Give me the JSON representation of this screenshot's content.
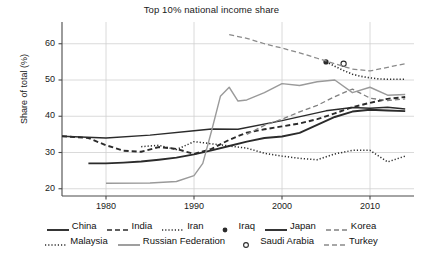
{
  "chart_data": {
    "type": "line",
    "title": "Top 10% national income share",
    "xlabel": "",
    "ylabel": "Share of total (%)",
    "xlim": [
      1975,
      2015
    ],
    "ylim": [
      18,
      66
    ],
    "xticks": [
      1980,
      1990,
      2000,
      2010
    ],
    "yticks": [
      20,
      30,
      40,
      50,
      60
    ],
    "grid": true,
    "legend_position": "bottom",
    "series": [
      {
        "name": "China",
        "style": "solid",
        "color": "#2b2b2b",
        "width": 1.9,
        "x": [
          1978,
          1980,
          1982,
          1984,
          1986,
          1988,
          1990,
          1992,
          1994,
          1996,
          1998,
          2000,
          2002,
          2004,
          2006,
          2008,
          2010,
          2012,
          2014
        ],
        "values": [
          27.0,
          27.0,
          27.2,
          27.5,
          28.0,
          28.6,
          29.5,
          30.6,
          31.8,
          33.0,
          34.0,
          34.4,
          35.4,
          37.6,
          39.8,
          41.3,
          41.8,
          41.6,
          41.4
        ]
      },
      {
        "name": "India",
        "style": "dashed",
        "color": "#2b2b2b",
        "width": 1.9,
        "x": [
          1975,
          1978,
          1980,
          1982,
          1984,
          1986,
          1988,
          1990,
          1992,
          1994,
          1996,
          1998,
          2000,
          2002,
          2004,
          2006,
          2008,
          2010,
          2012,
          2014
        ],
        "values": [
          34.5,
          34.0,
          32.0,
          30.5,
          30.2,
          31.5,
          31.0,
          29.6,
          31.0,
          33.5,
          35.5,
          36.4,
          37.2,
          38.0,
          39.2,
          40.8,
          42.5,
          43.7,
          44.8,
          45.3
        ]
      },
      {
        "name": "Iran",
        "style": "dotted",
        "color": "#2b2b2b",
        "width": 1.6,
        "x": [
          2005,
          2006,
          2007,
          2008,
          2009,
          2010,
          2011,
          2012,
          2013,
          2014
        ],
        "values": [
          55.0,
          53.8,
          52.6,
          51.6,
          51.0,
          50.6,
          50.3,
          50.2,
          50.2,
          50.2
        ]
      },
      {
        "name": "Iraq",
        "style": "marker-filled",
        "color": "#2b2b2b",
        "width": 0,
        "x": [
          2005
        ],
        "values": [
          55.0
        ]
      },
      {
        "name": "Japan",
        "style": "solid",
        "color": "#2b2b2b",
        "width": 1.4,
        "x": [
          1975,
          1980,
          1985,
          1990,
          1992,
          1995,
          2000,
          2005,
          2008,
          2010,
          2012,
          2014
        ],
        "values": [
          34.5,
          34.0,
          34.8,
          36.0,
          36.5,
          36.4,
          38.8,
          41.5,
          42.4,
          42.2,
          42.5,
          42.0
        ]
      },
      {
        "name": "Korea",
        "style": "dashed",
        "color": "#808080",
        "width": 1.3,
        "x": [
          1996,
          1998,
          2000,
          2002,
          2004,
          2006,
          2008,
          2010,
          2012,
          2014
        ],
        "values": [
          35.0,
          37.5,
          39.2,
          41.2,
          43.0,
          45.4,
          47.5,
          45.0,
          44.3,
          44.8
        ]
      },
      {
        "name": "Malaysia",
        "style": "dotted",
        "color": "#2b2b2b",
        "width": 1.5,
        "x": [
          1984,
          1986,
          1988,
          1990,
          1992,
          1994,
          1996,
          1998,
          2000,
          2002,
          2004,
          2006,
          2008,
          2010,
          2012,
          2014
        ],
        "values": [
          31.6,
          32.0,
          30.8,
          33.0,
          32.4,
          31.8,
          31.2,
          29.8,
          29.0,
          28.4,
          28.0,
          29.6,
          30.6,
          30.6,
          27.4,
          29.0
        ]
      },
      {
        "name": "Russian Federation",
        "style": "solid",
        "color": "#9a9a9a",
        "width": 1.4,
        "x": [
          1980,
          1985,
          1988,
          1990,
          1991,
          1992,
          1993,
          1994,
          1995,
          1996,
          1998,
          2000,
          2002,
          2004,
          2006,
          2008,
          2010,
          2012,
          2014
        ],
        "values": [
          21.5,
          21.6,
          22.0,
          23.6,
          27.0,
          36.0,
          45.5,
          48.0,
          44.2,
          44.5,
          46.5,
          49.0,
          48.5,
          49.5,
          50.0,
          46.5,
          48.0,
          45.8,
          46.0
        ]
      },
      {
        "name": "Saudi Arabia",
        "style": "marker-open",
        "color": "#2b2b2b",
        "width": 0,
        "x": [
          2007
        ],
        "values": [
          54.5
        ]
      },
      {
        "name": "Turkey",
        "style": "dashed",
        "color": "#8a8a8a",
        "width": 1.3,
        "x": [
          1994,
          1996,
          1998,
          2000,
          2002,
          2004,
          2006,
          2008,
          2010,
          2012,
          2014
        ],
        "values": [
          62.5,
          61.5,
          60.0,
          58.8,
          57.5,
          56.0,
          54.5,
          53.0,
          52.5,
          53.5,
          54.5
        ]
      }
    ]
  },
  "legend": {
    "rows": [
      [
        {
          "label": "China",
          "style": "solid",
          "color": "#2b2b2b"
        },
        {
          "label": "India",
          "style": "dashed",
          "color": "#2b2b2b"
        },
        {
          "label": "Iran",
          "style": "dotted",
          "color": "#2b2b2b"
        },
        {
          "label": "Iraq",
          "style": "marker-filled",
          "color": "#2b2b2b"
        },
        {
          "label": "Japan",
          "style": "solid",
          "color": "#2b2b2b"
        },
        {
          "label": "Korea",
          "style": "dashed",
          "color": "#808080"
        }
      ],
      [
        {
          "label": "Malaysia",
          "style": "dotted",
          "color": "#2b2b2b"
        },
        {
          "label": "Russian Federation",
          "style": "solid",
          "color": "#9a9a9a"
        },
        {
          "label": "Saudi Arabia",
          "style": "marker-open",
          "color": "#2b2b2b"
        },
        {
          "label": "Turkey",
          "style": "dashed",
          "color": "#8a8a8a"
        }
      ]
    ]
  },
  "axes": {
    "yticklabels": [
      "60",
      "50",
      "40",
      "30",
      "20"
    ],
    "xticklabels": [
      "1980",
      "1990",
      "2000",
      "2010"
    ]
  }
}
